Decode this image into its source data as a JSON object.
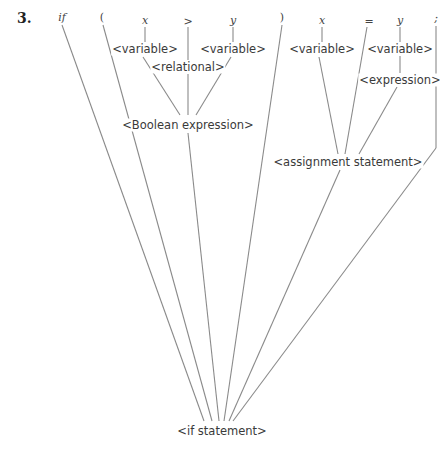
{
  "problem_number": "3.",
  "tokens": [
    {
      "id": "if",
      "text": "if",
      "x": 62,
      "y": 17,
      "italic": true
    },
    {
      "id": "lparen",
      "text": "(",
      "x": 102,
      "y": 17,
      "italic": false
    },
    {
      "id": "x1",
      "text": "x",
      "x": 145,
      "y": 20,
      "italic": true
    },
    {
      "id": "gt",
      "text": ">",
      "x": 188,
      "y": 21,
      "italic": false
    },
    {
      "id": "y1",
      "text": "y",
      "x": 233,
      "y": 20,
      "italic": true
    },
    {
      "id": "rparen",
      "text": ")",
      "x": 282,
      "y": 17,
      "italic": false
    },
    {
      "id": "x2",
      "text": "x",
      "x": 322,
      "y": 20,
      "italic": true
    },
    {
      "id": "eq",
      "text": "=",
      "x": 369,
      "y": 21,
      "italic": false
    },
    {
      "id": "y2",
      "text": "y",
      "x": 400,
      "y": 20,
      "italic": true
    },
    {
      "id": "semi",
      "text": ";",
      "x": 436,
      "y": 18,
      "italic": true
    }
  ],
  "nodes": {
    "var1": {
      "text": "<variable>",
      "x": 145,
      "y": 49
    },
    "var2": {
      "text": "<variable>",
      "x": 233,
      "y": 49
    },
    "relational": {
      "text": "<relational>",
      "x": 188,
      "y": 67
    },
    "var3": {
      "text": "<variable>",
      "x": 322,
      "y": 49
    },
    "var4": {
      "text": "<variable>",
      "x": 400,
      "y": 49
    },
    "expression": {
      "text": "<expression>",
      "x": 400,
      "y": 80
    },
    "boolean_expression": {
      "text": "<Boolean expression>",
      "x": 188,
      "y": 125
    },
    "assignment_statement": {
      "text": "<assignment statement>",
      "x": 348,
      "y": 162
    },
    "if_statement": {
      "text": "<if statement>",
      "x": 222,
      "y": 431
    }
  },
  "edges": [
    [
      145,
      27,
      145,
      42
    ],
    [
      233,
      27,
      233,
      42
    ],
    [
      322,
      27,
      322,
      42
    ],
    [
      400,
      27,
      400,
      42
    ],
    [
      400,
      56,
      400,
      73
    ],
    [
      188,
      27,
      188,
      60
    ],
    [
      143,
      57,
      180,
      115
    ],
    [
      188,
      74,
      188,
      115
    ],
    [
      231,
      57,
      196,
      115
    ],
    [
      319,
      57,
      338,
      154
    ],
    [
      367,
      27,
      345,
      154
    ],
    [
      397,
      87,
      359,
      154
    ],
    [
      62,
      25,
      204,
      421
    ],
    [
      103,
      25,
      212,
      421
    ],
    [
      188,
      133,
      219,
      421
    ],
    [
      282,
      25,
      224,
      421
    ],
    [
      340,
      170,
      229,
      421
    ],
    [
      436,
      26,
      436,
      148
    ],
    [
      436,
      148,
      233,
      421
    ]
  ]
}
